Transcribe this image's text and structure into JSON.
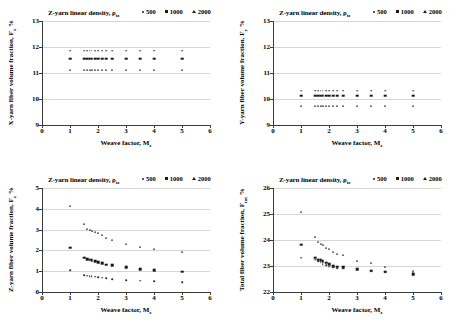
{
  "legend": {
    "title": "Z-yarn linear density, ρtz",
    "entries": [
      {
        "label": "500",
        "marker": "dot"
      },
      {
        "label": "1000",
        "marker": "square"
      },
      {
        "label": "2000",
        "marker": "triangle"
      }
    ]
  },
  "charts": [
    {
      "id": "x-yarn-fiber-volume-fraction",
      "type": "scatter",
      "title": "Z-yarn linear density, ρtz",
      "xlabel": "Weave factor, Mz",
      "ylabel": "X-yarn fiber volume fraction, Fx %",
      "xlim": [
        0,
        6
      ],
      "ylim": [
        9,
        13
      ],
      "xticks": [
        0,
        1,
        2,
        3,
        4,
        5,
        6
      ],
      "yticks": [
        9,
        10,
        11,
        12,
        13
      ],
      "grid": true,
      "legend_position": "top-right",
      "series": [
        {
          "name": "500",
          "marker": "dot",
          "points": [
            [
              1,
              11.85
            ],
            [
              1.5,
              11.85
            ],
            [
              1.62,
              11.85
            ],
            [
              1.7,
              11.85
            ],
            [
              1.78,
              11.85
            ],
            [
              1.9,
              11.85
            ],
            [
              2.0,
              11.85
            ],
            [
              2.15,
              11.85
            ],
            [
              2.3,
              11.85
            ],
            [
              2.5,
              11.85
            ],
            [
              3.0,
              11.85
            ],
            [
              3.5,
              11.85
            ],
            [
              4.0,
              11.85
            ],
            [
              5.0,
              11.85
            ]
          ]
        },
        {
          "name": "1000",
          "marker": "square",
          "points": [
            [
              1,
              11.55
            ],
            [
              1.5,
              11.55
            ],
            [
              1.62,
              11.55
            ],
            [
              1.7,
              11.55
            ],
            [
              1.78,
              11.55
            ],
            [
              1.9,
              11.55
            ],
            [
              2.0,
              11.55
            ],
            [
              2.15,
              11.55
            ],
            [
              2.3,
              11.55
            ],
            [
              2.5,
              11.55
            ],
            [
              3.0,
              11.55
            ],
            [
              3.5,
              11.55
            ],
            [
              4.0,
              11.55
            ],
            [
              5.0,
              11.55
            ]
          ]
        },
        {
          "name": "2000",
          "marker": "triangle",
          "points": [
            [
              1,
              11.1
            ],
            [
              1.5,
              11.1
            ],
            [
              1.62,
              11.1
            ],
            [
              1.7,
              11.1
            ],
            [
              1.78,
              11.1
            ],
            [
              1.9,
              11.1
            ],
            [
              2.0,
              11.1
            ],
            [
              2.15,
              11.1
            ],
            [
              2.3,
              11.1
            ],
            [
              2.5,
              11.1
            ],
            [
              3.0,
              11.1
            ],
            [
              3.5,
              11.1
            ],
            [
              4.0,
              11.1
            ],
            [
              5.0,
              11.1
            ]
          ]
        }
      ]
    },
    {
      "id": "y-yarn-fiber-volume-fraction",
      "type": "scatter",
      "title": "Z-yarn linear density, ρtz",
      "xlabel": "Weave factor, Mz",
      "ylabel": "Y-yarn fiber volume fraction, Fy %",
      "xlim": [
        0,
        6
      ],
      "ylim": [
        9,
        13
      ],
      "xticks": [
        0,
        1,
        2,
        3,
        4,
        5,
        6
      ],
      "yticks": [
        9,
        10,
        11,
        12,
        13
      ],
      "grid": true,
      "legend_position": "top-right",
      "series": [
        {
          "name": "500",
          "marker": "dot",
          "points": [
            [
              1,
              10.32
            ],
            [
              1.5,
              10.32
            ],
            [
              1.62,
              10.32
            ],
            [
              1.7,
              10.32
            ],
            [
              1.78,
              10.32
            ],
            [
              1.9,
              10.32
            ],
            [
              2.0,
              10.32
            ],
            [
              2.15,
              10.32
            ],
            [
              2.3,
              10.32
            ],
            [
              2.5,
              10.32
            ],
            [
              3.0,
              10.32
            ],
            [
              3.5,
              10.32
            ],
            [
              4.0,
              10.32
            ],
            [
              5.0,
              10.32
            ]
          ]
        },
        {
          "name": "1000",
          "marker": "square",
          "points": [
            [
              1,
              10.12
            ],
            [
              1.5,
              10.12
            ],
            [
              1.62,
              10.12
            ],
            [
              1.7,
              10.12
            ],
            [
              1.78,
              10.12
            ],
            [
              1.9,
              10.12
            ],
            [
              2.0,
              10.12
            ],
            [
              2.15,
              10.12
            ],
            [
              2.3,
              10.12
            ],
            [
              2.5,
              10.12
            ],
            [
              3.0,
              10.12
            ],
            [
              3.5,
              10.12
            ],
            [
              4.0,
              10.12
            ],
            [
              5.0,
              10.12
            ]
          ]
        },
        {
          "name": "2000",
          "marker": "triangle",
          "points": [
            [
              1,
              9.72
            ],
            [
              1.5,
              9.72
            ],
            [
              1.62,
              9.72
            ],
            [
              1.7,
              9.72
            ],
            [
              1.78,
              9.72
            ],
            [
              1.9,
              9.72
            ],
            [
              2.0,
              9.72
            ],
            [
              2.15,
              9.72
            ],
            [
              2.3,
              9.72
            ],
            [
              2.5,
              9.72
            ],
            [
              3.0,
              9.72
            ],
            [
              3.5,
              9.72
            ],
            [
              4.0,
              9.72
            ],
            [
              5.0,
              9.72
            ]
          ]
        }
      ]
    },
    {
      "id": "z-yarn-fiber-volume-fraction",
      "type": "scatter",
      "title": "Z-yarn linear density, ρtz",
      "xlabel": "Weave factor, Mz",
      "ylabel": "Z-yarn fiber volume fraction, Fz %",
      "xlim": [
        0,
        6
      ],
      "ylim": [
        0,
        5
      ],
      "xticks": [
        0,
        1,
        2,
        3,
        4,
        5,
        6
      ],
      "yticks": [
        0,
        1,
        2,
        3,
        4,
        5
      ],
      "grid": true,
      "legend_position": "top-right",
      "series": [
        {
          "name": "2000",
          "marker": "triangle",
          "points": [
            [
              1.0,
              4.15
            ],
            [
              1.5,
              3.25
            ],
            [
              1.62,
              3.05
            ],
            [
              1.7,
              2.98
            ],
            [
              1.78,
              2.95
            ],
            [
              1.9,
              2.88
            ],
            [
              2.0,
              2.82
            ],
            [
              2.15,
              2.72
            ],
            [
              2.3,
              2.62
            ],
            [
              2.5,
              2.5
            ],
            [
              3.0,
              2.3
            ],
            [
              3.5,
              2.15
            ],
            [
              4.0,
              2.05
            ],
            [
              5.0,
              1.9
            ]
          ]
        },
        {
          "name": "1000",
          "marker": "square",
          "points": [
            [
              1.0,
              2.12
            ],
            [
              1.5,
              1.65
            ],
            [
              1.62,
              1.58
            ],
            [
              1.7,
              1.55
            ],
            [
              1.78,
              1.52
            ],
            [
              1.9,
              1.48
            ],
            [
              2.0,
              1.42
            ],
            [
              2.15,
              1.38
            ],
            [
              2.3,
              1.32
            ],
            [
              2.5,
              1.28
            ],
            [
              3.0,
              1.18
            ],
            [
              3.5,
              1.1
            ],
            [
              4.0,
              1.05
            ],
            [
              5.0,
              0.97
            ]
          ]
        },
        {
          "name": "500",
          "marker": "dot",
          "points": [
            [
              1.0,
              1.05
            ],
            [
              1.5,
              0.82
            ],
            [
              1.62,
              0.78
            ],
            [
              1.7,
              0.76
            ],
            [
              1.78,
              0.75
            ],
            [
              1.9,
              0.73
            ],
            [
              2.0,
              0.71
            ],
            [
              2.15,
              0.68
            ],
            [
              2.3,
              0.65
            ],
            [
              2.5,
              0.62
            ],
            [
              3.0,
              0.58
            ],
            [
              3.5,
              0.54
            ],
            [
              4.0,
              0.51
            ],
            [
              5.0,
              0.47
            ]
          ]
        }
      ]
    },
    {
      "id": "total-fiber-volume-fraction",
      "type": "scatter",
      "title": "Z-yarn linear density, ρtz",
      "xlabel": "Weave factor, Mz",
      "ylabel": "Total fiber volume fraction, Ftot %",
      "xlim": [
        0,
        6
      ],
      "ylim": [
        22,
        26
      ],
      "xticks": [
        0,
        1,
        2,
        3,
        4,
        5,
        6
      ],
      "yticks": [
        22,
        23,
        24,
        25,
        26
      ],
      "grid": true,
      "legend_position": "top-right",
      "series": [
        {
          "name": "2000",
          "marker": "triangle",
          "points": [
            [
              1.0,
              25.08
            ],
            [
              1.5,
              24.1
            ],
            [
              1.62,
              23.92
            ],
            [
              1.7,
              23.85
            ],
            [
              1.78,
              23.8
            ],
            [
              1.9,
              23.7
            ],
            [
              2.0,
              23.65
            ],
            [
              2.15,
              23.55
            ],
            [
              2.3,
              23.48
            ],
            [
              2.5,
              23.42
            ],
            [
              3.0,
              23.2
            ],
            [
              3.5,
              23.1
            ],
            [
              4.0,
              22.98
            ],
            [
              5.0,
              22.82
            ],
            [
              5.0,
              22.72
            ]
          ]
        },
        {
          "name": "1000",
          "marker": "square",
          "points": [
            [
              1.0,
              23.82
            ],
            [
              1.5,
              23.32
            ],
            [
              1.62,
              23.25
            ],
            [
              1.7,
              23.22
            ],
            [
              1.78,
              23.18
            ],
            [
              1.9,
              23.12
            ],
            [
              2.0,
              23.08
            ],
            [
              2.15,
              23.0
            ],
            [
              2.3,
              22.98
            ],
            [
              2.5,
              22.95
            ],
            [
              3.0,
              22.88
            ],
            [
              3.5,
              22.82
            ],
            [
              4.0,
              22.78
            ],
            [
              5.0,
              22.68
            ]
          ]
        },
        {
          "name": "500",
          "marker": "dot",
          "points": [
            [
              1.0,
              23.32
            ],
            [
              1.5,
              23.25
            ],
            [
              1.62,
              23.18
            ],
            [
              1.7,
              23.12
            ],
            [
              1.78,
              23.08
            ],
            [
              1.9,
              23.02
            ],
            [
              2.0,
              22.98
            ],
            [
              2.15,
              22.95
            ],
            [
              2.3,
              22.92
            ],
            [
              2.5,
              22.9
            ],
            [
              3.0,
              22.85
            ],
            [
              3.5,
              22.8
            ],
            [
              4.0,
              22.76
            ],
            [
              5.0,
              22.66
            ]
          ]
        }
      ]
    }
  ]
}
